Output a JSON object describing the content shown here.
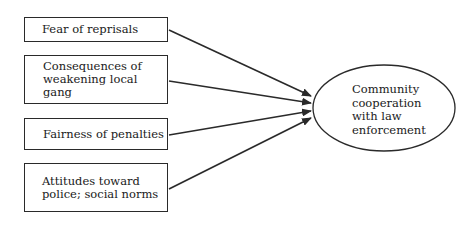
{
  "diagram": {
    "factors": [
      {
        "id": "fear",
        "label": "Fear of reprisals"
      },
      {
        "id": "consequences",
        "label": "Consequences of\nweakening local gang"
      },
      {
        "id": "fairness",
        "label": "Fairness of penalties"
      },
      {
        "id": "attitudes",
        "label": "Attitudes toward\npolice; social norms"
      }
    ],
    "outcome": {
      "label": "Community\ncooperation\nwith law\nenforcement"
    },
    "edges": [
      {
        "from": "fear",
        "to": "outcome"
      },
      {
        "from": "consequences",
        "to": "outcome"
      },
      {
        "from": "fairness",
        "to": "outcome"
      },
      {
        "from": "attitudes",
        "to": "outcome"
      }
    ],
    "colors": {
      "stroke": "#2a2a2a",
      "background": "#ffffff"
    }
  }
}
